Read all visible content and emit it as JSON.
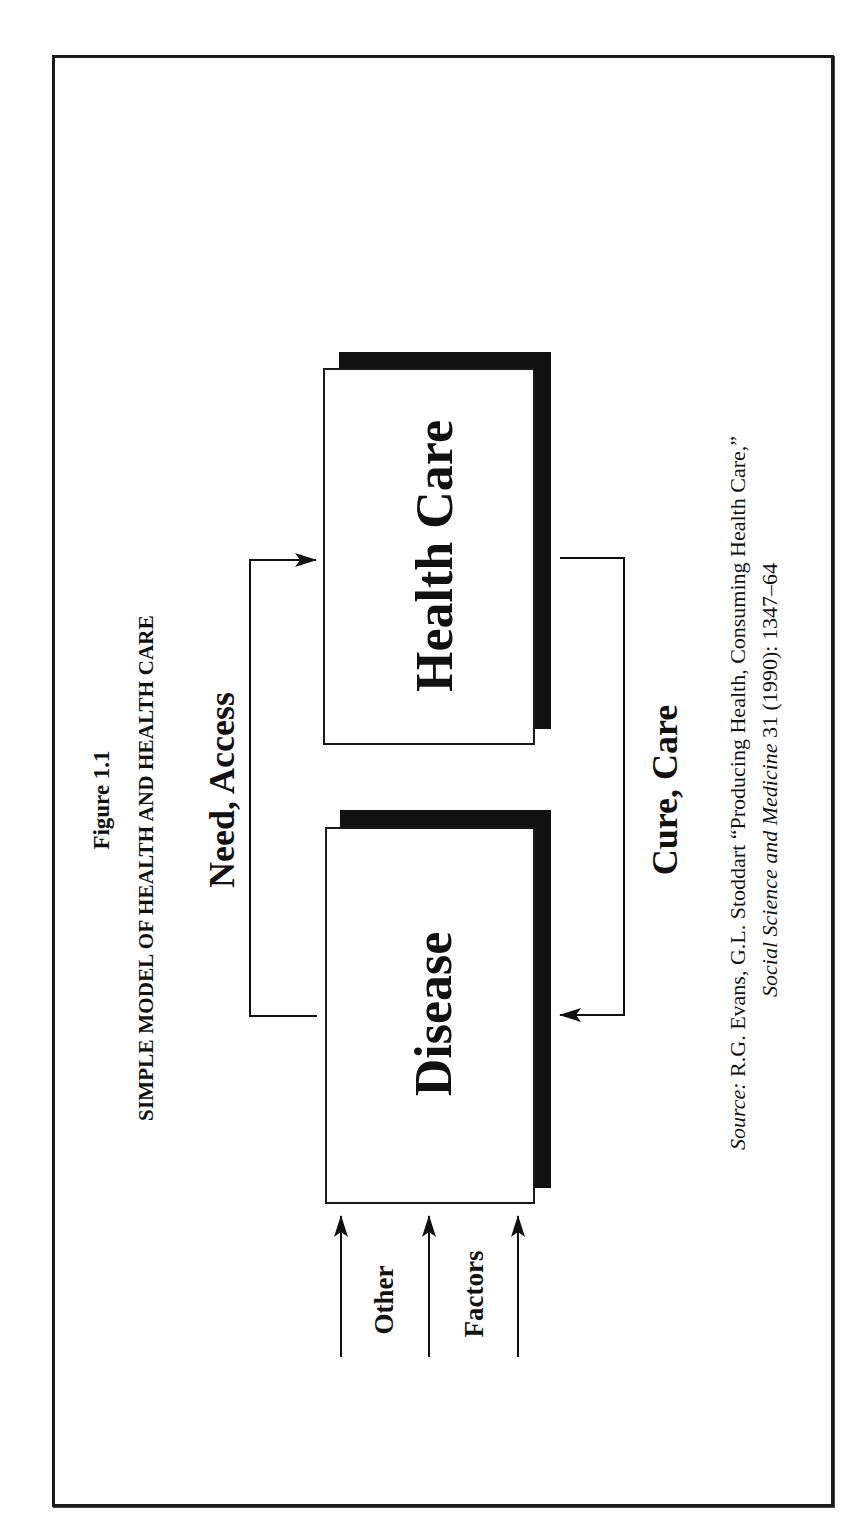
{
  "figure": {
    "number_label": "Figure 1.1",
    "title": "SIMPLE MODEL OF HEALTH AND HEALTH CARE",
    "orientation": "rotated -90deg (landscape figure on portrait page)"
  },
  "nodes": [
    {
      "id": "health-care",
      "label": "Health Care"
    },
    {
      "id": "disease",
      "label": "Disease"
    }
  ],
  "edges": [
    {
      "from": "disease",
      "to": "health-care",
      "label": "Need, Access"
    },
    {
      "from": "health-care",
      "to": "disease",
      "label": "Cure, Care"
    },
    {
      "from": "external",
      "to": "disease",
      "label": "Other Factors",
      "arrow_count": 3
    }
  ],
  "labels": {
    "need_access": "Need, Access",
    "cure_care": "Cure, Care",
    "other": "Other",
    "factors": "Factors"
  },
  "source": {
    "prefix": "Source:",
    "line1_rest": " R.G. Evans, G.L. Stoddart “Producing Health, Consuming Health Care,”",
    "journal": "Social Science and Medicine",
    "line2_rest": " 31 (1990): 1347–64"
  },
  "colors": {
    "ink": "#111111",
    "background": "#ffffff"
  }
}
